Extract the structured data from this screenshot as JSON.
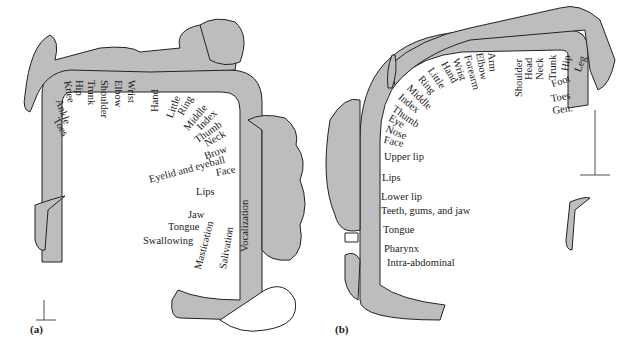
{
  "figure": {
    "panels": [
      {
        "id": "a",
        "label": "(a)",
        "arc_labels": [
          "Toes",
          "Ankle",
          "Knee",
          "Hip",
          "Trunk",
          "Shoulder",
          "Elbow",
          "Wrist",
          "Hand",
          "Little",
          "Ring",
          "Middle",
          "Index",
          "Thumb",
          "Neck",
          "Brow",
          "Eyelid and eyeball",
          "Face",
          "Lips",
          "Jaw",
          "Tongue",
          "Swallowing",
          "Mastication",
          "Salivation",
          "Vocalization"
        ]
      },
      {
        "id": "b",
        "label": "(b)",
        "arc_labels": [
          "Hand",
          "Wrist",
          "Forearm",
          "Elbow",
          "Arm",
          "Shoulder",
          "Head",
          "Neck",
          "Trunk",
          "Hip",
          "Leg",
          "Foot",
          "Toes",
          "Gen.",
          "Little",
          "Ring",
          "Middle",
          "Index",
          "Thumb",
          "Eye",
          "Nose",
          "Face",
          "Upper lip",
          "Lips",
          "Lower lip",
          "Teeth, gums, and jaw",
          "Tongue",
          "Pharynx",
          "Intra-abdominal"
        ]
      }
    ],
    "colors": {
      "cortex_fill": "#bdbdbd",
      "outline": "#222222",
      "background": "#ffffff"
    }
  }
}
